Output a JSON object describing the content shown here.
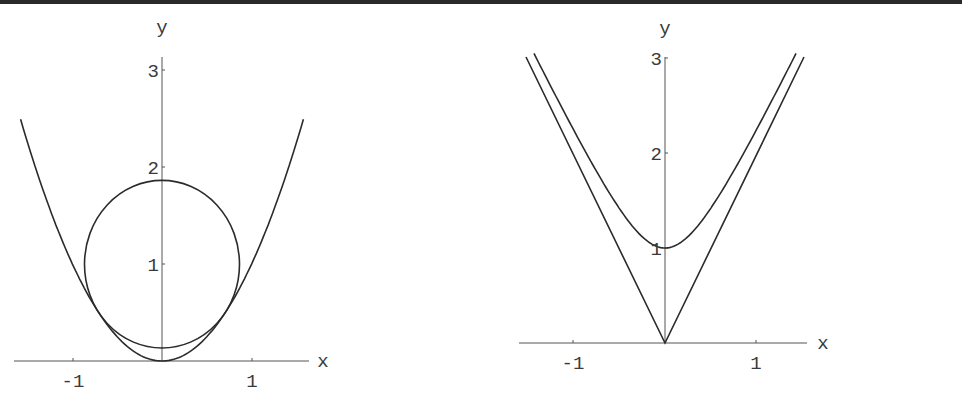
{
  "chart_data": [
    {
      "type": "line",
      "title": "",
      "xlabel": "x",
      "ylabel": "y",
      "xlim": [
        -1.65,
        1.65
      ],
      "ylim": [
        0,
        3.05
      ],
      "x_ticks": [
        -1,
        1
      ],
      "x_tick_labels": [
        "-1",
        "1"
      ],
      "y_ticks": [
        1,
        2,
        3
      ],
      "y_tick_labels": [
        "1",
        "2",
        "3"
      ],
      "grid": false,
      "legend": null,
      "series": [
        {
          "name": "parabola y = x^2",
          "x": [
            -1.58,
            -1.2,
            -0.8,
            -0.4,
            0,
            0.4,
            0.8,
            1.2,
            1.58
          ],
          "values": [
            2.5,
            1.44,
            0.64,
            0.16,
            0,
            0.16,
            0.64,
            1.44,
            2.5
          ]
        },
        {
          "name": "circle center (0,1) radius 0.866",
          "center": [
            0,
            1
          ],
          "radius": 0.866
        }
      ]
    },
    {
      "type": "line",
      "title": "",
      "xlabel": "x",
      "ylabel": "y",
      "xlim": [
        -1.6,
        1.6
      ],
      "ylim": [
        0,
        3.05
      ],
      "x_ticks": [
        -1,
        1
      ],
      "x_tick_labels": [
        "-1",
        "1"
      ],
      "y_ticks": [
        1,
        2,
        3
      ],
      "y_tick_labels": [
        "1",
        "2",
        "3"
      ],
      "grid": false,
      "legend": null,
      "series": [
        {
          "name": "hyperbola y = sqrt(1 + 4x^2)",
          "x": [
            -1.44,
            -1,
            -0.5,
            0,
            0.5,
            1,
            1.44
          ],
          "values": [
            3.06,
            2.24,
            1.41,
            1,
            1.41,
            2.24,
            3.06
          ]
        },
        {
          "name": "asymptotes y = 2|x|",
          "x": [
            -1.53,
            0,
            1.53
          ],
          "values": [
            3.06,
            0,
            3.06
          ]
        }
      ]
    }
  ],
  "plots": [
    {
      "xlabel": "x",
      "ylabel": "y",
      "xticks": [
        "-1",
        "1"
      ],
      "yticks": [
        "1",
        "2",
        "3"
      ]
    },
    {
      "xlabel": "x",
      "ylabel": "y",
      "xticks": [
        "-1",
        "1"
      ],
      "yticks": [
        "1",
        "2",
        "3"
      ]
    }
  ]
}
